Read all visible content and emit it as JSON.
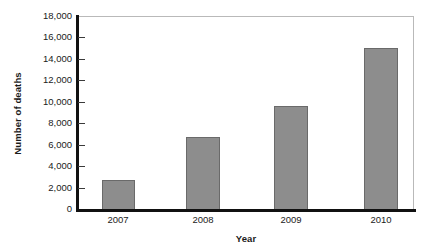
{
  "chart_data": {
    "type": "bar",
    "title": "",
    "xlabel": "Year",
    "ylabel": "Number of deaths",
    "categories": [
      "2007",
      "2008",
      "2009",
      "2010"
    ],
    "values": [
      2800,
      6800,
      9700,
      15100
    ],
    "series": [
      {
        "name": "Number of deaths",
        "values": [
          2800,
          6800,
          9700,
          15100
        ]
      }
    ],
    "ylim": [
      0,
      18000
    ],
    "ytick_labels": [
      "18,000",
      "16,000",
      "14,000",
      "12,000",
      "10,000",
      "8,000",
      "6,000",
      "4,000",
      "2,000",
      "0"
    ],
    "ytick_values": [
      18000,
      16000,
      14000,
      12000,
      10000,
      8000,
      6000,
      4000,
      2000,
      0
    ],
    "ytick_step": 2000,
    "grid": false,
    "legend": false,
    "legend_position": "none",
    "colors": {
      "bar_fill": "#8d8d8d",
      "bar_border": "#6a6a6a",
      "axis": "#111111",
      "frame": "#b9b9b9",
      "text": "#1b1b1b",
      "background": "#ffffff"
    }
  }
}
